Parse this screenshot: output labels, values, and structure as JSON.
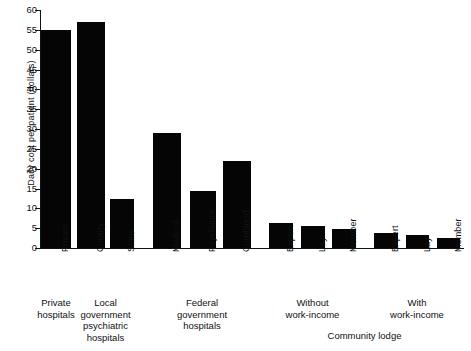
{
  "chart_data": {
    "type": "bar",
    "title": "",
    "xlabel": "",
    "ylabel": "Daily cost per patient (dollars)",
    "ylim": [
      0,
      60
    ],
    "yticks": [
      0,
      5,
      10,
      15,
      20,
      25,
      30,
      35,
      40,
      45,
      50,
      55,
      60
    ],
    "grid": false,
    "legend": "none",
    "categories": [
      "Private",
      "County",
      "State",
      "Medical",
      "Psychiatric",
      "Combined",
      "Expert",
      "Lay",
      "Member",
      "Expert",
      "Lay",
      "Member"
    ],
    "values": [
      55,
      57,
      12.4,
      29,
      14.4,
      21.9,
      6.2,
      5.5,
      4.9,
      3.9,
      3.2,
      2.6
    ],
    "groups": [
      {
        "label": "Private\nhospitals",
        "lines": [
          "Private",
          "hospitals"
        ],
        "bars": [
          0
        ]
      },
      {
        "label": "Local government psychiatric hospitals",
        "lines": [
          "Local",
          "government",
          "psychiatric",
          "hospitals"
        ],
        "bars": [
          1,
          2
        ]
      },
      {
        "label": "Federal government hospitals",
        "lines": [
          "Federal",
          "government",
          "hospitals"
        ],
        "bars": [
          3,
          4,
          5
        ]
      },
      {
        "label": "Without work-income",
        "lines": [
          "Without",
          "work-income"
        ],
        "bars": [
          6,
          7,
          8
        ]
      },
      {
        "label": "With work-income",
        "lines": [
          "With",
          "work-income"
        ],
        "bars": [
          9,
          10,
          11
        ]
      }
    ],
    "super_groups": [
      {
        "label": "Community lodge",
        "covers": [
          "Without work-income",
          "With work-income"
        ]
      }
    ],
    "bar_color": "#050505",
    "axis_color": "#111111"
  }
}
